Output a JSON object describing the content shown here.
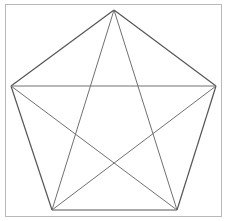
{
  "diagram": {
    "shape": "pentagon-with-all-diagonals",
    "vertices": [
      {
        "id": "top",
        "label": ""
      },
      {
        "id": "right",
        "label": ""
      },
      {
        "id": "bottom-right",
        "label": ""
      },
      {
        "id": "bottom-left",
        "label": ""
      },
      {
        "id": "left",
        "label": ""
      }
    ],
    "edges": [
      [
        "top",
        "right"
      ],
      [
        "right",
        "bottom-right"
      ],
      [
        "bottom-right",
        "bottom-left"
      ],
      [
        "bottom-left",
        "left"
      ],
      [
        "left",
        "top"
      ]
    ],
    "diagonals": [
      [
        "top",
        "bottom-right"
      ],
      [
        "top",
        "bottom-left"
      ],
      [
        "left",
        "right"
      ],
      [
        "left",
        "bottom-right"
      ],
      [
        "right",
        "bottom-left"
      ]
    ],
    "colors": {
      "frame": "#b8b8b8",
      "edge": "#555555",
      "diagonal": "#707070",
      "background": "#ffffff"
    }
  }
}
